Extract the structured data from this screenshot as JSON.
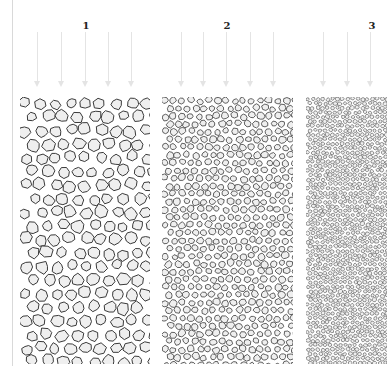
{
  "figure": {
    "colors": {
      "grain_fill": "#efefef",
      "grain_stroke": "#3a3a3a",
      "arrow": "#e4e4e4",
      "background": "#ffffff"
    },
    "panels": [
      {
        "label": "1",
        "label_x": 86,
        "x": 20,
        "width": 130,
        "arrows_x": [
          37,
          61,
          85,
          108,
          131
        ],
        "grain_size": 14,
        "stroke_width": 1.0,
        "seed": 11
      },
      {
        "label": "2",
        "label_x": 227,
        "x": 162,
        "width": 131,
        "arrows_x": [
          181,
          203,
          226,
          250,
          273
        ],
        "grain_size": 8,
        "stroke_width": 0.8,
        "seed": 23
      },
      {
        "label": "3",
        "label_x": 372,
        "x": 306,
        "width": 81,
        "arrows_x": [
          323,
          347,
          370
        ],
        "grain_size": 4.6,
        "stroke_width": 0.55,
        "seed": 37
      }
    ]
  }
}
